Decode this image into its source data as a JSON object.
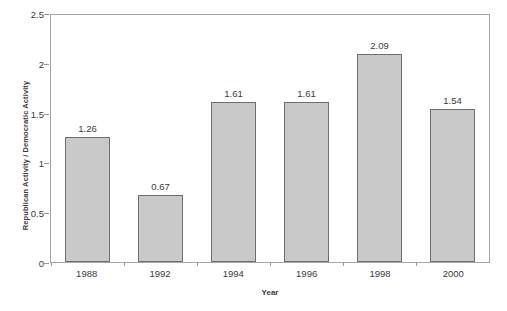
{
  "chart_data": {
    "type": "bar",
    "title": "",
    "subtitle": "",
    "xlabel": "Year",
    "ylabel": "Republican Activity / Democratic Activity",
    "categories": [
      "1988",
      "1992",
      "1994",
      "1996",
      "1998",
      "2000"
    ],
    "values": [
      1.26,
      0.67,
      1.61,
      1.61,
      2.09,
      1.54
    ],
    "value_labels": [
      "1.26",
      "0.67",
      "1.61",
      "1.61",
      "2.09",
      "1.54"
    ],
    "series": [
      {
        "name": "Republican Activity / Democratic Activity",
        "values": [
          1.26,
          0.67,
          1.61,
          1.61,
          2.09,
          1.54
        ]
      }
    ],
    "ylim": [
      0,
      2.5
    ],
    "ytick_values": [
      0,
      0.5,
      1,
      1.5,
      2,
      2.5
    ],
    "ytick_labels": [
      "0",
      "0.5",
      "1",
      "1.5",
      "2",
      "2.5"
    ],
    "grid": false,
    "legend": false,
    "legend_position": "none",
    "colors": {
      "bar_fill": "#c9c9c9",
      "bar_border": "#6e6e6e",
      "axis_line": "#a6a6a6",
      "text": "#3a3a3a",
      "background": "#ffffff"
    }
  }
}
